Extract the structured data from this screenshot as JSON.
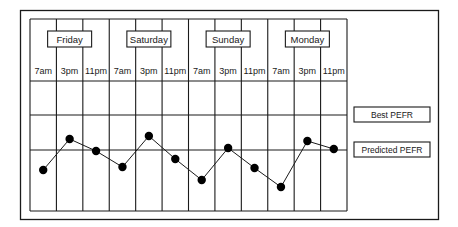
{
  "chart_data": {
    "type": "line",
    "title": "",
    "xlabel": "",
    "ylabel": "",
    "grid": true,
    "days": [
      "Friday",
      "Saturday",
      "Sunday",
      "Monday"
    ],
    "times": [
      "7am",
      "3pm",
      "11pm"
    ],
    "categories": [
      "Friday 7am",
      "Friday 3pm",
      "Friday 11pm",
      "Saturday 7am",
      "Saturday 3pm",
      "Saturday 11pm",
      "Sunday 7am",
      "Sunday 3pm",
      "Sunday 11pm",
      "Monday 7am",
      "Monday 3pm",
      "Monday 11pm"
    ],
    "reference_lines": [
      {
        "name": "Best PEFR",
        "level": 35
      },
      {
        "name": "Predicted PEFR",
        "level": 0
      }
    ],
    "series": [
      {
        "name": "PEFR readings",
        "values": [
          -20,
          11,
          -1,
          -17,
          14,
          -9,
          -30,
          2,
          -18,
          -37,
          9,
          1
        ]
      }
    ],
    "legend": [
      "Best PEFR",
      "Predicted PEFR"
    ],
    "legend_position": "right",
    "ylim": [
      -60,
      62
    ]
  },
  "colors": {
    "line": "#1a1a1a",
    "marker": "#000000",
    "background": "#ffffff"
  }
}
